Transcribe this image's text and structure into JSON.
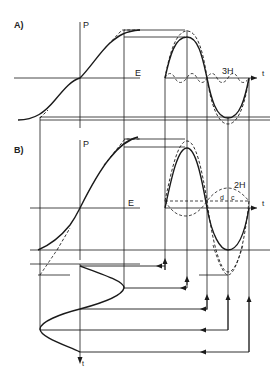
{
  "figure": {
    "panel_a": {
      "label": "A)",
      "axis_p": "P",
      "axis_e": "E",
      "axis_t": "t",
      "harmonic_label": "3H"
    },
    "panel_b": {
      "label": "B)",
      "axis_p": "P",
      "axis_e": "E",
      "axis_t": "t",
      "harmonic_label": "2H",
      "point_d": "d",
      "point_c": "c"
    },
    "input_axis": {
      "axis_t": "t"
    },
    "colors": {
      "line": "#1a1a1a",
      "background": "#ffffff"
    }
  }
}
